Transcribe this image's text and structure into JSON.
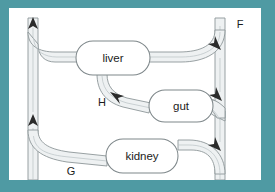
{
  "figure": {
    "frame_color": "#4f9aa3",
    "panel_color": "#ffffff",
    "vessel_fill_color": "#eef1f2",
    "vessel_stroke_color": "#8d9699",
    "organ_fill_color": "#ffffff",
    "organ_stroke_color": "#7e878a",
    "label_color": "#1b1b1b"
  },
  "organs": [
    {
      "id": "liver",
      "label": "liver",
      "cx": 104,
      "cy": 50,
      "rx": 37,
      "ry": 17
    },
    {
      "id": "gut",
      "label": "gut",
      "cx": 172,
      "cy": 98,
      "rx": 32,
      "ry": 16
    },
    {
      "id": "kidney",
      "label": "kidney",
      "cx": 133,
      "cy": 148,
      "rx": 36,
      "ry": 17
    }
  ],
  "flow_labels": [
    {
      "id": "F",
      "label": "F",
      "x": 231,
      "y": 17
    },
    {
      "id": "H",
      "label": "H",
      "x": 93,
      "y": 95
    },
    {
      "id": "G",
      "label": "G",
      "x": 62,
      "y": 164
    }
  ],
  "vessels": [
    {
      "id": "left-trunk",
      "name": "ascending-venous-trunk",
      "direction": "up"
    },
    {
      "id": "right-trunk",
      "name": "descending-arterial-trunk",
      "direction": "down"
    },
    {
      "id": "liver-outflow",
      "name": "liver-to-left-trunk",
      "direction": "left"
    },
    {
      "id": "liver-inflow",
      "name": "right-trunk-to-liver",
      "direction": "left"
    },
    {
      "id": "portal-vein",
      "name": "gut-to-liver-portal",
      "direction": "up-left"
    },
    {
      "id": "gut-inflow",
      "name": "right-trunk-to-gut",
      "direction": "left"
    },
    {
      "id": "kidney-outflow",
      "name": "kidney-to-left-trunk",
      "direction": "left"
    },
    {
      "id": "kidney-inflow",
      "name": "right-trunk-to-kidney",
      "direction": "left"
    }
  ],
  "arrows": [
    {
      "id": "left-top",
      "name": "upward-flow-arrow-top",
      "x": 24,
      "y": 14,
      "points": "up"
    },
    {
      "id": "left-mid",
      "name": "upward-flow-arrow-middle",
      "x": 24,
      "y": 111,
      "points": "up"
    },
    {
      "id": "right-liver",
      "name": "inflow-arrow-liver-branch",
      "x": 211,
      "y": 40,
      "points": "down-right"
    },
    {
      "id": "right-gut",
      "name": "inflow-arrow-gut-branch",
      "x": 211,
      "y": 90,
      "points": "down-right"
    },
    {
      "id": "right-kidney",
      "name": "inflow-arrow-kidney-branch",
      "x": 211,
      "y": 140,
      "points": "down-right"
    },
    {
      "id": "portal",
      "name": "portal-flow-arrow",
      "x": 105,
      "y": 86,
      "points": "up-left"
    }
  ]
}
